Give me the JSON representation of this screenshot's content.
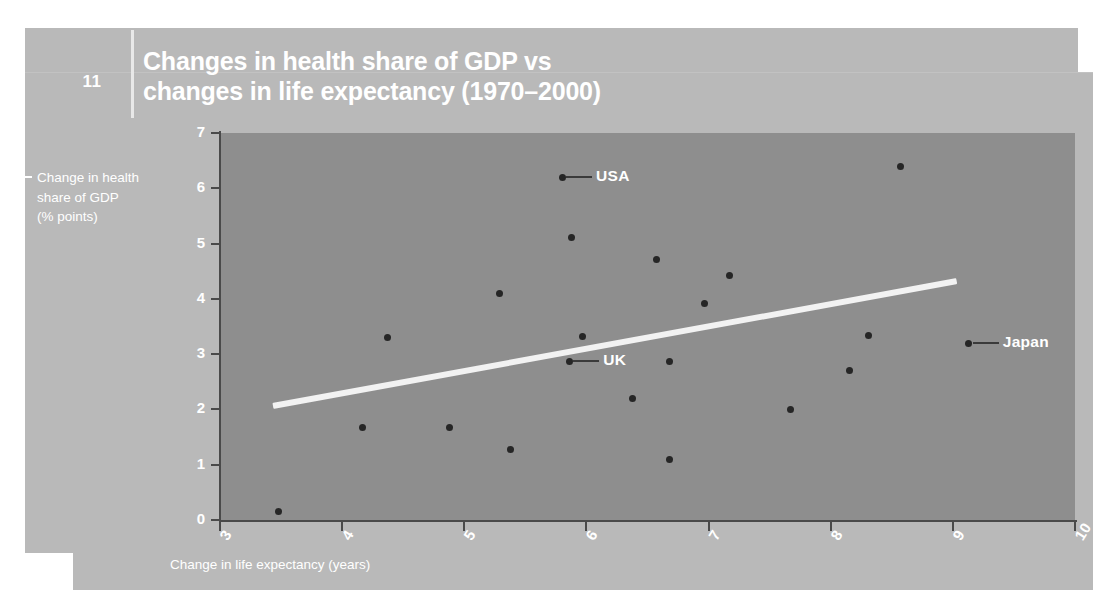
{
  "slide": {
    "number": "11",
    "title_line1": "Changes in health share of GDP vs",
    "title_line2": "changes in life expectancy (1970–2000)",
    "panel_color": "#b9b9b9",
    "title_color": "#ffffff"
  },
  "chart_data": {
    "type": "scatter",
    "title": "Changes in health share of GDP vs changes in life expectancy (1970–2000)",
    "xlabel": "Change in life expectancy (years)",
    "ylabel": "Change in health share of GDP (% points)",
    "ylabel_lines": [
      "Change in health",
      "share of GDP",
      "(% points)"
    ],
    "xlim": [
      3,
      10
    ],
    "ylim": [
      0,
      7
    ],
    "xticks": [
      3,
      4,
      5,
      6,
      7,
      8,
      9,
      10
    ],
    "xtick_labels": [
      "3",
      "4",
      "5",
      "6",
      "7",
      "8",
      "9",
      "10"
    ],
    "yticks": [
      0,
      1,
      2,
      3,
      4,
      5,
      6,
      7
    ],
    "ytick_labels": [
      "0",
      "1",
      "2",
      "3",
      "4",
      "5",
      "6",
      "7"
    ],
    "grid": false,
    "legend": "none",
    "plot_bg": "#8e8e8e",
    "marker_color": "#262626",
    "trendline_color": "#f2f2f2",
    "points": [
      {
        "x": 3.48,
        "y": 0.16,
        "label": ""
      },
      {
        "x": 4.17,
        "y": 1.68,
        "label": ""
      },
      {
        "x": 4.37,
        "y": 3.31,
        "label": ""
      },
      {
        "x": 4.88,
        "y": 1.68,
        "label": ""
      },
      {
        "x": 5.29,
        "y": 4.09,
        "label": ""
      },
      {
        "x": 5.38,
        "y": 1.28,
        "label": ""
      },
      {
        "x": 5.8,
        "y": 6.2,
        "label": "USA"
      },
      {
        "x": 5.88,
        "y": 5.11,
        "label": ""
      },
      {
        "x": 5.86,
        "y": 2.87,
        "label": "UK"
      },
      {
        "x": 5.97,
        "y": 3.32,
        "label": ""
      },
      {
        "x": 6.38,
        "y": 2.2,
        "label": ""
      },
      {
        "x": 6.57,
        "y": 4.72,
        "label": ""
      },
      {
        "x": 6.68,
        "y": 2.87,
        "label": ""
      },
      {
        "x": 6.68,
        "y": 1.1,
        "label": ""
      },
      {
        "x": 6.97,
        "y": 3.92,
        "label": ""
      },
      {
        "x": 7.17,
        "y": 4.43,
        "label": ""
      },
      {
        "x": 7.67,
        "y": 2.0,
        "label": ""
      },
      {
        "x": 8.15,
        "y": 2.7,
        "label": ""
      },
      {
        "x": 8.31,
        "y": 3.34,
        "label": ""
      },
      {
        "x": 8.57,
        "y": 6.4,
        "label": ""
      },
      {
        "x": 9.13,
        "y": 3.2,
        "label": "Japan"
      }
    ],
    "trendline": {
      "x0": 3.43,
      "y0": 2.07,
      "x1": 9.03,
      "y1": 4.33
    },
    "annotations": [
      {
        "text": "USA",
        "point_x": 5.8,
        "point_y": 6.2
      },
      {
        "text": "UK",
        "point_x": 5.86,
        "point_y": 2.87
      },
      {
        "text": "Japan",
        "point_x": 9.13,
        "point_y": 3.2
      }
    ]
  }
}
